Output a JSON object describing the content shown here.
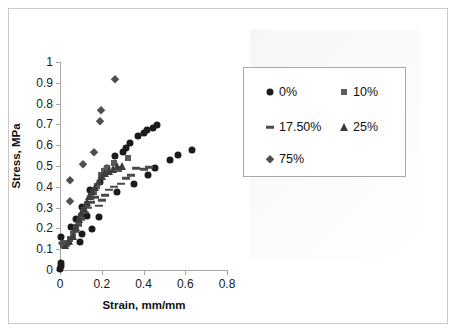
{
  "chart_data": {
    "type": "scatter",
    "title": "",
    "xlabel": "Strain, mm/mm",
    "ylabel": "Stress, MPa",
    "xlim": [
      0,
      0.8
    ],
    "ylim": [
      0,
      1
    ],
    "xticks": [
      "0",
      "0.2",
      "0.4",
      "0.6",
      "0.8"
    ],
    "xtick_values": [
      0,
      0.2,
      0.4,
      0.6,
      0.8
    ],
    "yticks": [
      "0",
      "0.1",
      "0.2",
      "0.3",
      "0.4",
      "0.5",
      "0.6",
      "0.7",
      "0.8",
      "0.9",
      "1"
    ],
    "ytick_values": [
      0,
      0.1,
      0.2,
      0.3,
      0.4,
      0.5,
      0.6,
      0.7,
      0.8,
      0.9,
      1
    ],
    "grid": false,
    "legend_position": "upper-right",
    "series": [
      {
        "name": "0%",
        "marker": "circle",
        "color": "#1b1b1b",
        "points": [
          [
            0.002,
            0.005
          ],
          [
            0.003,
            0.02
          ],
          [
            0.004,
            0.035
          ],
          [
            0.005,
            0.16
          ],
          [
            0.055,
            0.205
          ],
          [
            0.075,
            0.245
          ],
          [
            0.095,
            0.135
          ],
          [
            0.105,
            0.175
          ],
          [
            0.105,
            0.305
          ],
          [
            0.13,
            0.26
          ],
          [
            0.145,
            0.385
          ],
          [
            0.155,
            0.195
          ],
          [
            0.185,
            0.255
          ],
          [
            0.19,
            0.425
          ],
          [
            0.225,
            0.49
          ],
          [
            0.265,
            0.55
          ],
          [
            0.275,
            0.375
          ],
          [
            0.3,
            0.565
          ],
          [
            0.315,
            0.585
          ],
          [
            0.335,
            0.61
          ],
          [
            0.355,
            0.415
          ],
          [
            0.375,
            0.645
          ],
          [
            0.4,
            0.66
          ],
          [
            0.415,
            0.675
          ],
          [
            0.42,
            0.455
          ],
          [
            0.445,
            0.685
          ],
          [
            0.455,
            0.49
          ],
          [
            0.465,
            0.695
          ],
          [
            0.525,
            0.53
          ],
          [
            0.565,
            0.555
          ],
          [
            0.63,
            0.578
          ]
        ]
      },
      {
        "name": "10%",
        "marker": "square",
        "color": "#5a5a5a",
        "points": [
          [
            0.02,
            0.13
          ],
          [
            0.035,
            0.125
          ],
          [
            0.05,
            0.15
          ],
          [
            0.06,
            0.175
          ],
          [
            0.075,
            0.195
          ],
          [
            0.09,
            0.225
          ],
          [
            0.1,
            0.26
          ],
          [
            0.115,
            0.29
          ],
          [
            0.13,
            0.315
          ],
          [
            0.15,
            0.35
          ],
          [
            0.165,
            0.375
          ],
          [
            0.175,
            0.405
          ],
          [
            0.195,
            0.455
          ],
          [
            0.21,
            0.475
          ],
          [
            0.225,
            0.49
          ],
          [
            0.26,
            0.515
          ],
          [
            0.285,
            0.485
          ],
          [
            0.325,
            0.54
          ]
        ]
      },
      {
        "name": "17.50%",
        "marker": "dash",
        "color": "#4a4a4a",
        "points": [
          [
            0.02,
            0.115
          ],
          [
            0.04,
            0.13
          ],
          [
            0.055,
            0.155
          ],
          [
            0.07,
            0.185
          ],
          [
            0.085,
            0.215
          ],
          [
            0.1,
            0.245
          ],
          [
            0.12,
            0.275
          ],
          [
            0.135,
            0.3
          ],
          [
            0.15,
            0.325
          ],
          [
            0.17,
            0.35
          ],
          [
            0.185,
            0.31
          ],
          [
            0.2,
            0.335
          ],
          [
            0.215,
            0.36
          ],
          [
            0.235,
            0.385
          ],
          [
            0.26,
            0.4
          ],
          [
            0.29,
            0.415
          ],
          [
            0.315,
            0.44
          ],
          [
            0.34,
            0.455
          ],
          [
            0.365,
            0.49
          ],
          [
            0.4,
            0.485
          ],
          [
            0.425,
            0.495
          ]
        ]
      },
      {
        "name": "25%",
        "marker": "triangle",
        "color": "#3d3d3d",
        "points": [
          [
            0.025,
            0.12
          ],
          [
            0.045,
            0.14
          ],
          [
            0.06,
            0.165
          ],
          [
            0.075,
            0.205
          ],
          [
            0.09,
            0.245
          ],
          [
            0.1,
            0.275
          ],
          [
            0.115,
            0.3
          ],
          [
            0.13,
            0.325
          ],
          [
            0.14,
            0.355
          ],
          [
            0.155,
            0.38
          ],
          [
            0.17,
            0.4
          ],
          [
            0.185,
            0.43
          ],
          [
            0.2,
            0.45
          ],
          [
            0.215,
            0.465
          ],
          [
            0.235,
            0.475
          ],
          [
            0.255,
            0.485
          ],
          [
            0.275,
            0.5
          ],
          [
            0.295,
            0.5
          ]
        ]
      },
      {
        "name": "75%",
        "marker": "diamond",
        "color": "#4f4f4f",
        "points": [
          [
            0.01,
            0.13
          ],
          [
            0.05,
            0.33
          ],
          [
            0.05,
            0.435
          ],
          [
            0.11,
            0.51
          ],
          [
            0.165,
            0.565
          ],
          [
            0.19,
            0.715
          ],
          [
            0.195,
            0.77
          ],
          [
            0.265,
            0.92
          ]
        ]
      }
    ]
  },
  "legend": {
    "entries": [
      {
        "label": "0%",
        "marker": "circle"
      },
      {
        "label": "10%",
        "marker": "square"
      },
      {
        "label": "17.50%",
        "marker": "dash"
      },
      {
        "label": "25%",
        "marker": "triangle"
      },
      {
        "label": "75%",
        "marker": "diamond"
      }
    ]
  }
}
